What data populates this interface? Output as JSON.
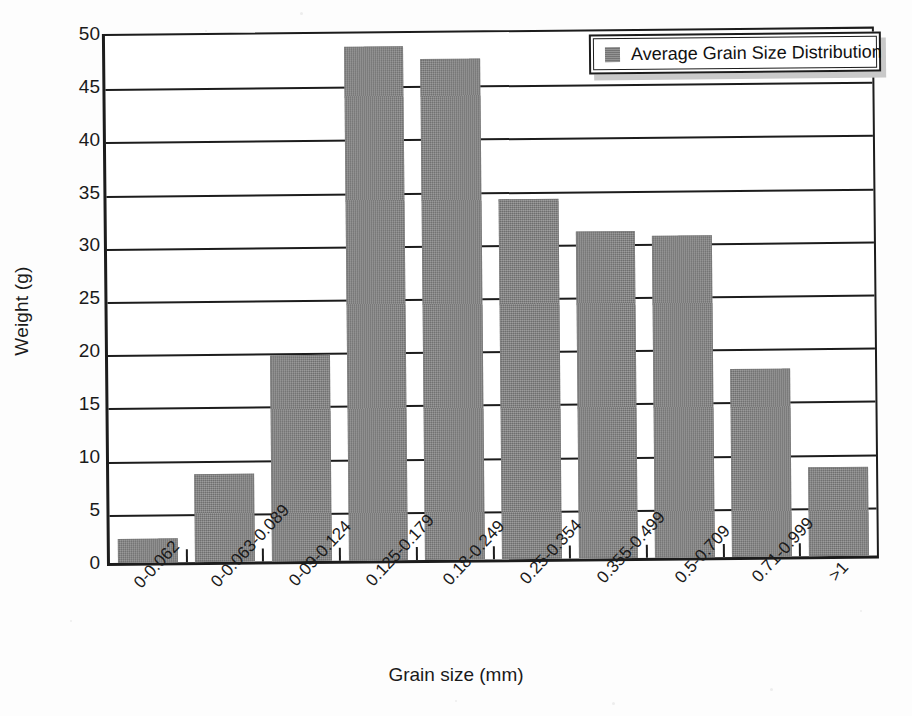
{
  "chart_data": {
    "type": "bar",
    "title": "",
    "xlabel": "Grain size (mm)",
    "ylabel": "Weight (g)",
    "categories": [
      "0-0.062",
      "0-0.063-0.089",
      "0-09-0.124",
      "0.125-0.179",
      "0.18-0.249",
      "0.25-0.354",
      "0.355-0.499",
      "0.5-0.709",
      "0.71-0.999",
      ">1"
    ],
    "values": [
      2.3,
      8.3,
      19.4,
      48.3,
      47.1,
      33.8,
      30.7,
      30.3,
      17.7,
      8.4
    ],
    "series": [
      {
        "name": "Average Grain Size Distribution",
        "values": [
          2.3,
          8.3,
          19.4,
          48.3,
          47.1,
          33.8,
          30.7,
          30.3,
          17.7,
          8.4
        ]
      }
    ],
    "ylim": [
      0,
      50
    ],
    "ytick_values": [
      0,
      5,
      10,
      15,
      20,
      25,
      30,
      35,
      40,
      45,
      50
    ],
    "ytick_labels": [
      "0",
      "5",
      "10",
      "15",
      "20",
      "25",
      "30",
      "35",
      "40",
      "45",
      "50"
    ],
    "grid": true,
    "grid_axis": "y",
    "legend": {
      "position": "top-right",
      "entries": [
        {
          "label": "Average Grain Size Distribution",
          "color": "#7d7d7d"
        }
      ]
    },
    "bar_color": "#7d7d7d",
    "axis_color": "#1c1c1c",
    "background": "#ffffff"
  }
}
